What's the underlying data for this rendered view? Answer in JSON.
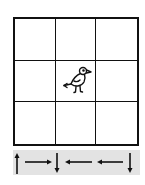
{
  "puzzle": {
    "grid": {
      "rows": 3,
      "cols": 3,
      "bird_position": {
        "row": 2,
        "col": 2
      }
    },
    "sequence": [
      "up",
      "right",
      "down",
      "left",
      "left",
      "down"
    ],
    "icons": {
      "bird": "bird-icon"
    },
    "colors": {
      "lines": "#111111",
      "band": "#e3e3e3",
      "background": "#ffffff"
    }
  }
}
